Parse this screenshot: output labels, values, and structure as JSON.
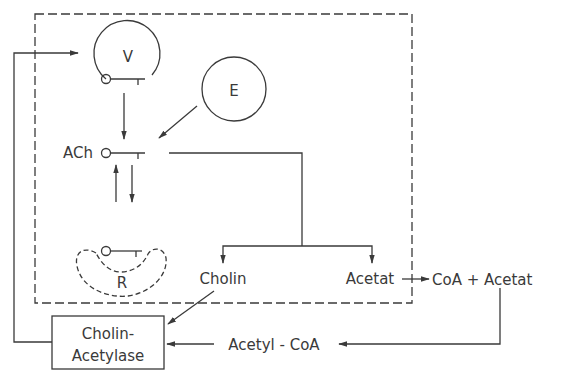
{
  "diagram": {
    "type": "acetylcholine synthesis and breakdown cycle",
    "labels": {
      "vesicle": "V",
      "enzyme": "E",
      "ach": "ACh",
      "receptor": "R",
      "cholin": "Cholin",
      "acetat": "Acetat",
      "coa_acetat": "CoA + Acetat",
      "enzyme_box_line1": "Cholin-",
      "enzyme_box_line2": "Acetylase",
      "acetyl_coa": "Acetyl - CoA"
    },
    "nodes": [
      {
        "id": "V",
        "label": "V",
        "shape": "circle-open"
      },
      {
        "id": "E",
        "label": "E",
        "shape": "circle"
      },
      {
        "id": "ACh",
        "label": "ACh",
        "shape": "molecule-symbol"
      },
      {
        "id": "R",
        "label": "R",
        "shape": "dashed-receptor"
      },
      {
        "id": "Cholin",
        "label": "Cholin",
        "shape": "text"
      },
      {
        "id": "Acetat",
        "label": "Acetat",
        "shape": "text"
      },
      {
        "id": "CoAAcetat",
        "label": "CoA + Acetat",
        "shape": "text"
      },
      {
        "id": "ChAT",
        "label": "Cholin-Acetylase",
        "shape": "box"
      },
      {
        "id": "AcetylCoA",
        "label": "Acetyl - CoA",
        "shape": "text"
      }
    ],
    "edges": [
      {
        "from": "V",
        "to": "ACh"
      },
      {
        "from": "E",
        "to": "ACh"
      },
      {
        "from": "ACh",
        "to": "R",
        "bidirectional": true
      },
      {
        "from": "ACh",
        "to": "Cholin"
      },
      {
        "from": "ACh",
        "to": "Acetat"
      },
      {
        "from": "Acetat",
        "to": "CoAAcetat"
      },
      {
        "from": "CoAAcetat",
        "to": "AcetylCoA"
      },
      {
        "from": "AcetylCoA",
        "to": "ChAT"
      },
      {
        "from": "Cholin",
        "to": "ChAT"
      },
      {
        "from": "ChAT",
        "to": "V"
      }
    ],
    "colors": {
      "ink": "#3a3a3a",
      "background": "#ffffff"
    }
  }
}
